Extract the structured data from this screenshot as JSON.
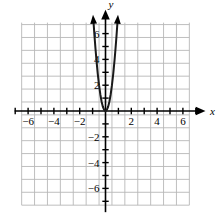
{
  "chart_data": {
    "type": "line",
    "title": "",
    "xlabel": "x",
    "ylabel": "y",
    "xlim": [
      -7,
      7
    ],
    "ylim": [
      -7.5,
      7
    ],
    "grid": true,
    "legend": false,
    "x_tick_labels": [
      "-6",
      "-4",
      "-2",
      "2",
      "4",
      "6"
    ],
    "x_tick_values": [
      -6,
      -4,
      -2,
      2,
      4,
      6
    ],
    "y_tick_labels": [
      "6",
      "4",
      "2",
      "-2",
      "-4",
      "-6"
    ],
    "y_tick_values": [
      6,
      4,
      2,
      -2,
      -4,
      -6
    ],
    "x_minor_ticks": [
      -7,
      -6,
      -5,
      -4,
      -3,
      -2,
      -1,
      1,
      2,
      3,
      4,
      5,
      6,
      7
    ],
    "y_minor_ticks": [
      -7,
      -6,
      -5,
      -4,
      -3,
      -2,
      -1,
      1,
      2,
      3,
      4,
      5,
      6
    ],
    "series": [
      {
        "name": "parabola",
        "equation": "y = 8x^2",
        "color": "#1a1a1a",
        "vertex": [
          0,
          0
        ],
        "arrowheads": [
          "start",
          "end"
        ],
        "x": [
          -0.92,
          -0.85,
          -0.78,
          -0.7,
          -0.6,
          -0.5,
          -0.4,
          -0.3,
          -0.2,
          -0.1,
          0,
          0.1,
          0.2,
          0.3,
          0.4,
          0.5,
          0.6,
          0.7,
          0.78,
          0.85,
          0.92
        ],
        "values": [
          6.77,
          5.78,
          4.87,
          3.92,
          2.88,
          2.0,
          1.28,
          0.72,
          0.32,
          0.08,
          0,
          0.08,
          0.32,
          0.72,
          1.28,
          2.0,
          2.88,
          3.92,
          4.87,
          5.78,
          6.77
        ]
      }
    ],
    "axis_arrows": {
      "x_positive": true,
      "y_positive": true
    }
  }
}
